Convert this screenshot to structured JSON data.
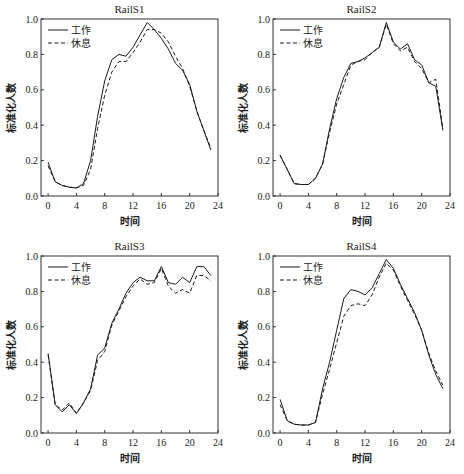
{
  "legend": {
    "work": "工作",
    "rest": "休息"
  },
  "xlabel": "时间",
  "ylabel": "标准化人数",
  "x_ticks": [
    0,
    4,
    8,
    12,
    16,
    20,
    24
  ],
  "y_ticks": [
    "0.0",
    "0.2",
    "0.4",
    "0.6",
    "0.8",
    "1.0"
  ],
  "colors": {
    "line": "#1a1a1a",
    "axis": "#333333"
  },
  "chart_data": [
    {
      "type": "line",
      "title": "RailS1",
      "xlabel": "时间",
      "ylabel": "标准化人数",
      "xlim": [
        -1,
        24
      ],
      "ylim": [
        0,
        1.0
      ],
      "x": [
        0,
        1,
        2,
        3,
        4,
        5,
        6,
        7,
        8,
        9,
        10,
        11,
        12,
        13,
        14,
        15,
        16,
        17,
        18,
        19,
        20,
        21,
        22,
        23
      ],
      "series": [
        {
          "name": "工作",
          "style": "solid",
          "values": [
            0.19,
            0.08,
            0.06,
            0.05,
            0.045,
            0.07,
            0.2,
            0.45,
            0.65,
            0.77,
            0.8,
            0.79,
            0.84,
            0.91,
            0.98,
            0.94,
            0.89,
            0.83,
            0.75,
            0.71,
            0.63,
            0.48,
            0.37,
            0.26
          ]
        },
        {
          "name": "休息",
          "style": "dashed",
          "values": [
            0.17,
            0.08,
            0.06,
            0.05,
            0.045,
            0.06,
            0.15,
            0.38,
            0.57,
            0.7,
            0.76,
            0.76,
            0.81,
            0.87,
            0.94,
            0.94,
            0.92,
            0.87,
            0.79,
            0.72,
            0.62,
            0.48,
            0.37,
            0.27
          ]
        }
      ]
    },
    {
      "type": "line",
      "title": "RailS2",
      "xlabel": "时间",
      "ylabel": "标准化人数",
      "xlim": [
        -1,
        24
      ],
      "ylim": [
        0,
        1.0
      ],
      "x": [
        0,
        1,
        2,
        3,
        4,
        5,
        6,
        7,
        8,
        9,
        10,
        11,
        12,
        13,
        14,
        15,
        16,
        17,
        18,
        19,
        20,
        21,
        22,
        23
      ],
      "series": [
        {
          "name": "工作",
          "style": "solid",
          "values": [
            0.23,
            0.15,
            0.07,
            0.065,
            0.065,
            0.1,
            0.18,
            0.38,
            0.55,
            0.67,
            0.75,
            0.76,
            0.78,
            0.81,
            0.84,
            0.98,
            0.87,
            0.83,
            0.86,
            0.77,
            0.74,
            0.64,
            0.62,
            0.37
          ]
        },
        {
          "name": "休息",
          "style": "dashed",
          "values": [
            0.23,
            0.15,
            0.07,
            0.065,
            0.065,
            0.1,
            0.18,
            0.36,
            0.52,
            0.63,
            0.74,
            0.76,
            0.77,
            0.81,
            0.84,
            0.97,
            0.86,
            0.82,
            0.84,
            0.76,
            0.72,
            0.64,
            0.66,
            0.38
          ]
        }
      ]
    },
    {
      "type": "line",
      "title": "RailS3",
      "xlabel": "时间",
      "ylabel": "标准化人数",
      "xlim": [
        -1,
        24
      ],
      "ylim": [
        0,
        1.0
      ],
      "x": [
        0,
        1,
        2,
        3,
        4,
        5,
        6,
        7,
        8,
        9,
        10,
        11,
        12,
        13,
        14,
        15,
        16,
        17,
        18,
        19,
        20,
        21,
        22,
        23
      ],
      "series": [
        {
          "name": "工作",
          "style": "solid",
          "values": [
            0.45,
            0.16,
            0.12,
            0.16,
            0.11,
            0.17,
            0.25,
            0.44,
            0.48,
            0.62,
            0.7,
            0.79,
            0.85,
            0.88,
            0.86,
            0.86,
            0.94,
            0.85,
            0.84,
            0.88,
            0.85,
            0.94,
            0.94,
            0.89
          ]
        },
        {
          "name": "休息",
          "style": "dashed",
          "values": [
            0.44,
            0.16,
            0.13,
            0.17,
            0.11,
            0.17,
            0.24,
            0.41,
            0.46,
            0.61,
            0.69,
            0.77,
            0.83,
            0.87,
            0.84,
            0.85,
            0.93,
            0.83,
            0.79,
            0.81,
            0.79,
            0.89,
            0.89,
            0.86
          ]
        }
      ]
    },
    {
      "type": "line",
      "title": "RailS4",
      "xlabel": "时间",
      "ylabel": "标准化人数",
      "xlim": [
        -1,
        24
      ],
      "ylim": [
        0,
        1.0
      ],
      "x": [
        0,
        1,
        2,
        3,
        4,
        5,
        6,
        7,
        8,
        9,
        10,
        11,
        12,
        13,
        14,
        15,
        16,
        17,
        18,
        19,
        20,
        21,
        22,
        23
      ],
      "series": [
        {
          "name": "工作",
          "style": "solid",
          "values": [
            0.19,
            0.07,
            0.05,
            0.045,
            0.045,
            0.06,
            0.25,
            0.4,
            0.58,
            0.76,
            0.81,
            0.8,
            0.78,
            0.82,
            0.9,
            0.98,
            0.93,
            0.84,
            0.76,
            0.68,
            0.58,
            0.44,
            0.33,
            0.25
          ]
        },
        {
          "name": "休息",
          "style": "dashed",
          "values": [
            0.16,
            0.07,
            0.05,
            0.045,
            0.045,
            0.06,
            0.22,
            0.36,
            0.51,
            0.66,
            0.72,
            0.73,
            0.72,
            0.78,
            0.88,
            0.96,
            0.92,
            0.83,
            0.75,
            0.67,
            0.58,
            0.45,
            0.35,
            0.27
          ]
        }
      ]
    }
  ]
}
